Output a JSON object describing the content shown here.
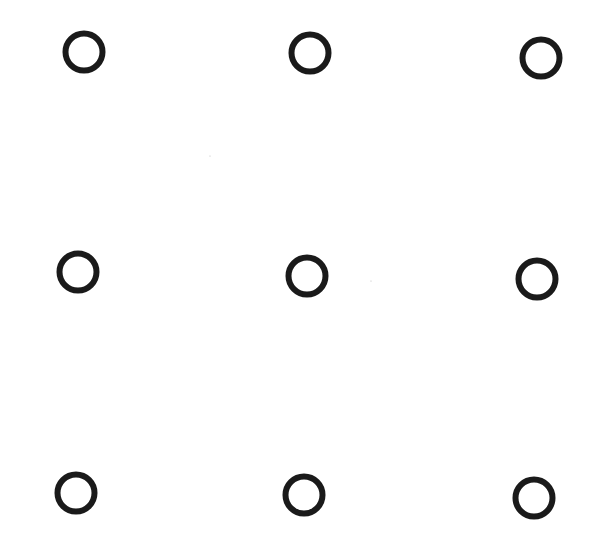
{
  "diagram": {
    "type": "dot-grid",
    "rows": 3,
    "cols": 3,
    "stroke_color": "#1a1a1a",
    "background": "#ffffff",
    "circle_radius": 18.5,
    "stroke_width": 6,
    "circles": [
      {
        "row": 1,
        "col": 1,
        "cx": 84,
        "cy": 52
      },
      {
        "row": 1,
        "col": 2,
        "cx": 310,
        "cy": 53
      },
      {
        "row": 1,
        "col": 3,
        "cx": 541,
        "cy": 58
      },
      {
        "row": 2,
        "col": 1,
        "cx": 78,
        "cy": 272
      },
      {
        "row": 2,
        "col": 2,
        "cx": 307,
        "cy": 276
      },
      {
        "row": 2,
        "col": 3,
        "cx": 537,
        "cy": 279
      },
      {
        "row": 3,
        "col": 1,
        "cx": 76,
        "cy": 493
      },
      {
        "row": 3,
        "col": 2,
        "cx": 304,
        "cy": 495
      },
      {
        "row": 3,
        "col": 3,
        "cx": 534,
        "cy": 498
      }
    ],
    "specks": [
      {
        "cx": 210,
        "cy": 156
      },
      {
        "cx": 371,
        "cy": 281
      }
    ]
  }
}
